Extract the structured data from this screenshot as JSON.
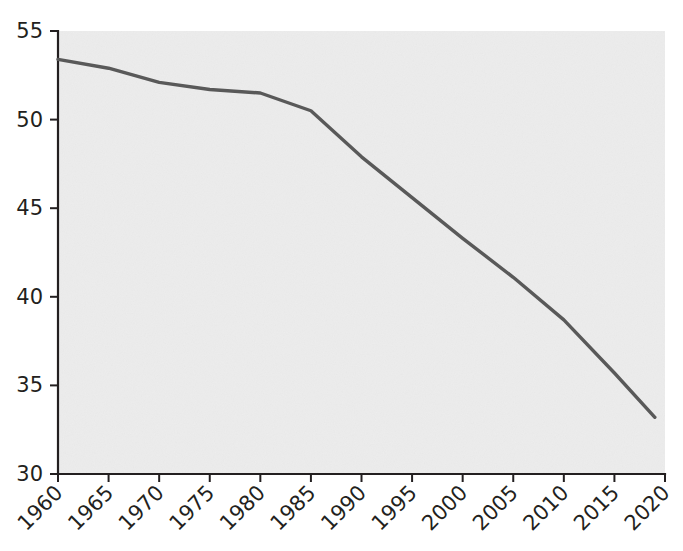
{
  "chart_data": {
    "type": "line",
    "title": "",
    "subtitle": "",
    "xlabel": "",
    "ylabel": "",
    "x": [
      1960,
      1965,
      1970,
      1975,
      1980,
      1985,
      1990,
      1995,
      2000,
      2005,
      2010,
      2015,
      2019
    ],
    "values": [
      53.4,
      52.9,
      52.1,
      51.7,
      51.5,
      50.5,
      47.9,
      45.6,
      43.3,
      41.1,
      38.7,
      35.7,
      33.2
    ],
    "series": [
      {
        "name": "series-1",
        "color": "#595959",
        "values": [
          53.4,
          52.9,
          52.1,
          51.7,
          51.5,
          50.5,
          47.9,
          45.6,
          43.3,
          41.1,
          38.7,
          35.7,
          33.2
        ]
      }
    ],
    "xlim": [
      1960,
      2020
    ],
    "ylim": [
      30,
      55
    ],
    "xticks": [
      1960,
      1965,
      1970,
      1975,
      1980,
      1985,
      1990,
      1995,
      2000,
      2005,
      2010,
      2015,
      2020
    ],
    "yticks": [
      30,
      35,
      40,
      45,
      50,
      55
    ],
    "xtick_labels": [
      "1960",
      "1965",
      "1970",
      "1975",
      "1980",
      "1985",
      "1990",
      "1995",
      "2000",
      "2005",
      "2010",
      "2015",
      "2020"
    ],
    "ytick_labels": [
      "30",
      "35",
      "40",
      "45",
      "50",
      "55"
    ],
    "xtick_rotation": -45,
    "grid": false,
    "legend": false,
    "legend_position": "none",
    "annotations": [],
    "colors": {
      "line": "#595959",
      "plot_background": "#ededed",
      "page_background": "#ffffff",
      "axis": "#231f20",
      "tick_text": "#231f20"
    }
  },
  "layout": {
    "plot_left": 58,
    "plot_right": 665,
    "plot_top": 31,
    "plot_bottom": 474,
    "tick_length": 8
  }
}
